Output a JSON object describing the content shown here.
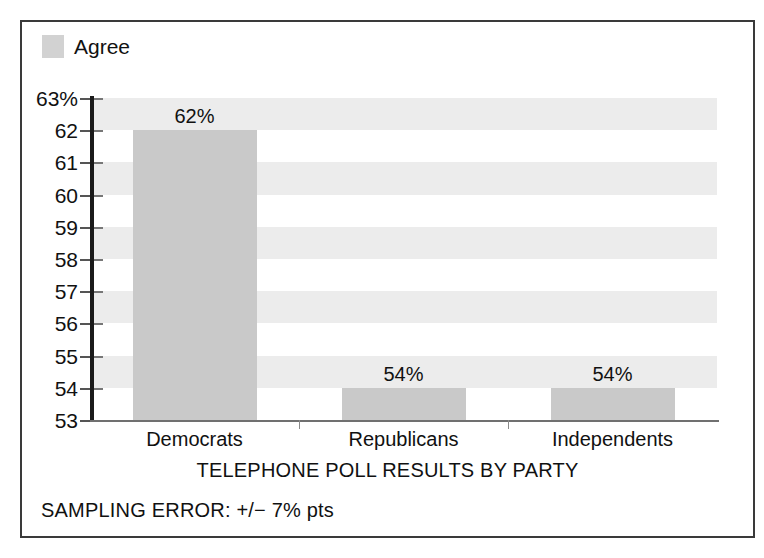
{
  "figure": {
    "legend": {
      "swatch_icon": "legend-swatch",
      "label": "Agree",
      "color": "#d2d2d2"
    },
    "axis_title": "TELEPHONE POLL RESULTS BY PARTY",
    "footnote": "SAMPLING ERROR: +/− 7% pts",
    "frame_color": "#3a3a3a",
    "band_color": "#ececec"
  },
  "chart_data": {
    "type": "bar",
    "title": "",
    "xlabel": "TELEPHONE POLL RESULTS BY PARTY",
    "ylabel": "",
    "categories": [
      "Democrats",
      "Republicans",
      "Independents"
    ],
    "values": [
      62,
      54,
      54
    ],
    "value_labels": [
      "62%",
      "54%",
      "54%"
    ],
    "series": [
      {
        "name": "Agree",
        "values": [
          62,
          54,
          54
        ],
        "color": "#c9c9c9"
      }
    ],
    "ylim": [
      53,
      63
    ],
    "ytick_values": [
      63,
      62,
      61,
      60,
      59,
      58,
      57,
      56,
      55,
      54,
      53
    ],
    "ytick_labels": [
      "63%",
      "62",
      "61",
      "60",
      "59",
      "58",
      "57",
      "56",
      "55",
      "54",
      "53"
    ],
    "grid": "horizontal-bands",
    "legend": [
      "Agree"
    ],
    "legend_position": "top-left",
    "annotation": "SAMPLING ERROR: +/− 7% pts"
  }
}
